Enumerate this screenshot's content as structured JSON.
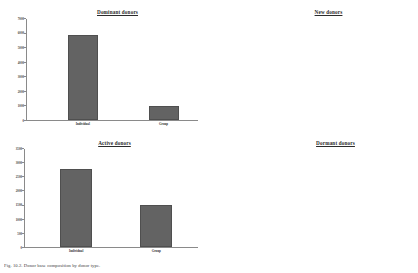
{
  "figure": {
    "caption": "Fig. 10.2. Donor base composition by donor type.",
    "bar_color": "#636363",
    "axis_color": "#8a8a8a"
  },
  "chart_data": [
    {
      "type": "bar",
      "title": "Dominant donors",
      "categories": [
        "Individual",
        "Group"
      ],
      "values": [
        5900,
        1000
      ],
      "xlabel": "",
      "ylabel": "",
      "ylim": [
        0,
        7000
      ],
      "yticks": [
        0,
        1000,
        2000,
        3000,
        4000,
        5000,
        6000,
        7000
      ],
      "ytick_labels": [
        "0",
        "1000",
        "2000",
        "3000",
        "4000",
        "5000",
        "6000",
        "7000"
      ],
      "grid": false,
      "legend": "none"
    },
    {
      "type": "bar",
      "title": "New donors",
      "categories": [
        "Individual",
        "Group"
      ],
      "values": [
        11800,
        3000
      ],
      "xlabel": "",
      "ylabel": "",
      "ylim": [
        0,
        14000
      ],
      "yticks": [
        0,
        2000,
        4000,
        6000,
        8000,
        10000,
        12000,
        14000
      ],
      "ytick_labels": [
        "0",
        "2000",
        "4000",
        "6000",
        "8000",
        "10000",
        "12000",
        "14000"
      ],
      "grid": false,
      "legend": "none"
    },
    {
      "type": "bar",
      "title": "Active donors",
      "categories": [
        "Individual",
        "Group"
      ],
      "values": [
        2800,
        1500
      ],
      "xlabel": "",
      "ylabel": "",
      "ylim": [
        0,
        3500
      ],
      "yticks": [
        0,
        500,
        1000,
        1500,
        2000,
        2500,
        3000,
        3500
      ],
      "ytick_labels": [
        "0",
        "500",
        "1000",
        "1500",
        "2000",
        "2500",
        "3000",
        "3500"
      ],
      "grid": false,
      "legend": "none"
    },
    {
      "type": "bar",
      "title": "Dormant donors",
      "categories": [
        "Individual",
        "Group"
      ],
      "values": [
        1800,
        1350
      ],
      "xlabel": "",
      "ylabel": "",
      "ylim": [
        1000,
        1850
      ],
      "yticks": [
        1000,
        1100,
        1200,
        1300,
        1400,
        1500,
        1600,
        1700,
        1800,
        1850
      ],
      "ytick_labels": [
        "1000",
        "1100",
        "1200",
        "1300",
        "1400",
        "1500",
        "1600",
        "1700",
        "1800",
        "1850"
      ],
      "grid": false,
      "legend": "none"
    }
  ]
}
